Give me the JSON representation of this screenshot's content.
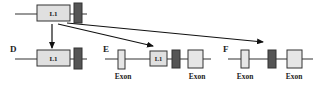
{
  "diagram": {
    "colors": {
      "line": "#333333",
      "l1_fill": "#e0e0e0",
      "exon_fill": "#e6e6e6",
      "dark_box_fill": "#555555",
      "box_stroke": "#333333",
      "arrow": "#111111"
    },
    "top_row": {
      "l1_label": "L1"
    },
    "panels": [
      {
        "id": "D",
        "label": "D",
        "l1_label": "L1"
      },
      {
        "id": "E",
        "label": "E",
        "l1_label": "L1",
        "exon_labels": [
          "Exon",
          "Exon"
        ]
      },
      {
        "id": "F",
        "label": "F",
        "exon_labels": [
          "Exon",
          "Exon"
        ]
      }
    ]
  }
}
